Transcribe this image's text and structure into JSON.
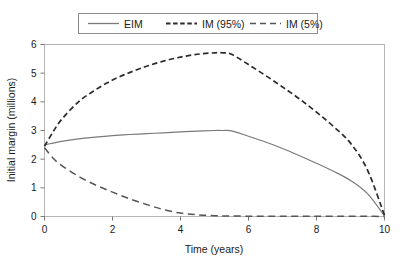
{
  "chart_data": {
    "type": "line",
    "title": "",
    "xlabel": "Time (years)",
    "ylabel": "Initial margin (millions)",
    "xlim": [
      0,
      10
    ],
    "ylim": [
      0,
      6
    ],
    "xticks": [
      0,
      2,
      4,
      6,
      8,
      10
    ],
    "yticks": [
      0,
      1,
      2,
      3,
      4,
      5,
      6
    ],
    "xtick_labels": [
      "0",
      "2",
      "4",
      "6",
      "8",
      "10"
    ],
    "ytick_labels": [
      "0",
      "1",
      "2",
      "3",
      "4",
      "5",
      "6"
    ],
    "grid": false,
    "legend_position": "top-center",
    "x": [
      0,
      0.25,
      0.5,
      1,
      1.5,
      2,
      2.5,
      3,
      3.5,
      4,
      4.5,
      5,
      5.25,
      5.5,
      6,
      6.5,
      7,
      7.5,
      8,
      8.5,
      9,
      9.5,
      10
    ],
    "series": [
      {
        "name": "EIM",
        "style": "solid",
        "values": [
          2.5,
          2.56,
          2.62,
          2.71,
          2.77,
          2.82,
          2.86,
          2.89,
          2.92,
          2.95,
          2.98,
          3.0,
          3.0,
          2.99,
          2.8,
          2.6,
          2.37,
          2.12,
          1.86,
          1.58,
          1.26,
          0.8,
          0.02
        ]
      },
      {
        "name": "IM (95%)",
        "style": "dashed-short",
        "values": [
          2.45,
          2.95,
          3.38,
          4.0,
          4.42,
          4.76,
          5.02,
          5.24,
          5.42,
          5.56,
          5.66,
          5.71,
          5.71,
          5.66,
          5.3,
          4.92,
          4.52,
          4.1,
          3.64,
          3.14,
          2.56,
          1.62,
          0.04
        ]
      },
      {
        "name": "IM (5%)",
        "style": "dashed-long",
        "values": [
          2.4,
          2.04,
          1.78,
          1.4,
          1.1,
          0.85,
          0.62,
          0.42,
          0.24,
          0.12,
          0.06,
          0.03,
          0.02,
          0.02,
          0.01,
          0.01,
          0.01,
          0.01,
          0.01,
          0.01,
          0.01,
          0.01,
          0.0
        ]
      }
    ],
    "legend_entries": [
      "EIM",
      "IM (95%)",
      "IM (5%)"
    ],
    "colors": {
      "eim": "#7a7a7a",
      "im95": "#2b2b2b",
      "im05": "#555555",
      "axis": "#b5b5b5",
      "text": "#1a1a1a",
      "background": "#ffffff"
    }
  }
}
